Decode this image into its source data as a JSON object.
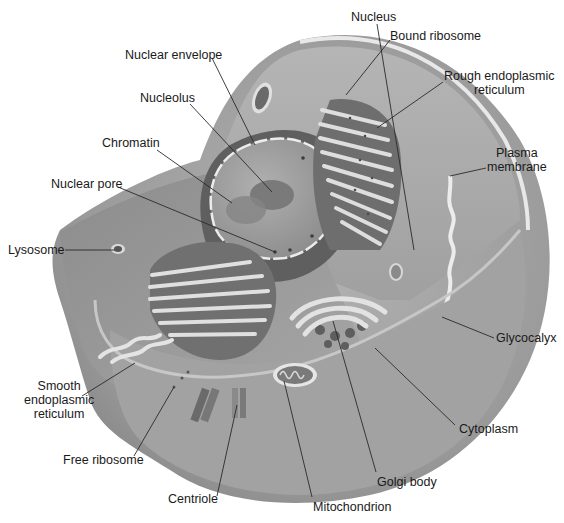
{
  "diagram": {
    "colors": {
      "background": "#ffffff",
      "cell_outer": "#8f8f8f",
      "cell_mid": "#a3a3a3",
      "cell_light": "#b8b8b8",
      "cut_face": "#9a9a9a",
      "membrane": "#e4e4e4",
      "nucleus_dark": "#5e5e5e",
      "nucleus_fill": "#9c9c9c",
      "organelle_light": "#dedede",
      "organelle_dark": "#6a6a6a",
      "leader_line": "#2a2a2a",
      "text": "#1a1a1a"
    },
    "labels": [
      {
        "id": "nucleus",
        "text": "Nucleus",
        "x": 351,
        "y": 10,
        "align": "left",
        "line": [
          [
            377,
            24
          ],
          [
            414,
            250
          ]
        ]
      },
      {
        "id": "nuclear-envelope",
        "text": "Nuclear envelope",
        "x": 125,
        "y": 48,
        "align": "left",
        "line": [
          [
            212,
            58
          ],
          [
            255,
            145
          ]
        ]
      },
      {
        "id": "bound-ribosome",
        "text": "Bound ribosome",
        "x": 390,
        "y": 29,
        "align": "left",
        "line": [
          [
            390,
            40
          ],
          [
            346,
            95
          ]
        ]
      },
      {
        "id": "rough-er",
        "text": "Rough endoplasmic\nreticulum",
        "x": 444,
        "y": 69,
        "align": "center",
        "line": [
          [
            443,
            82
          ],
          [
            377,
            128
          ]
        ]
      },
      {
        "id": "nucleolus",
        "text": "Nucleolus",
        "x": 140,
        "y": 91,
        "align": "left",
        "line": [
          [
            190,
            104
          ],
          [
            272,
            192
          ]
        ]
      },
      {
        "id": "chromatin",
        "text": "Chromatin",
        "x": 102,
        "y": 136,
        "align": "left",
        "line": [
          [
            157,
            150
          ],
          [
            232,
            203
          ]
        ]
      },
      {
        "id": "plasma-membrane",
        "text": "Plasma\nmembrane",
        "x": 487,
        "y": 146,
        "align": "center",
        "line": [
          [
            486,
            168
          ],
          [
            450,
            176
          ]
        ]
      },
      {
        "id": "nuclear-pore",
        "text": "Nuclear pore",
        "x": 51,
        "y": 177,
        "align": "left",
        "line": [
          [
            118,
            187
          ],
          [
            275,
            252
          ]
        ]
      },
      {
        "id": "lysosome",
        "text": "Lysosome",
        "x": 8,
        "y": 243,
        "align": "left",
        "line": [
          [
            65,
            250
          ],
          [
            115,
            250
          ]
        ]
      },
      {
        "id": "glycocalyx",
        "text": "Glycocalyx",
        "x": 496,
        "y": 331,
        "align": "left",
        "line": [
          [
            494,
            338
          ],
          [
            442,
            317
          ]
        ]
      },
      {
        "id": "smooth-er",
        "text": "Smooth\nendoplasmic\nreticulum",
        "x": 24,
        "y": 379,
        "align": "center",
        "line": [
          [
            82,
            396
          ],
          [
            135,
            363
          ]
        ]
      },
      {
        "id": "cytoplasm",
        "text": "Cytoplasm",
        "x": 459,
        "y": 422,
        "align": "left",
        "line": [
          [
            455,
            425
          ],
          [
            375,
            348
          ]
        ]
      },
      {
        "id": "free-ribosome",
        "text": "Free ribosome",
        "x": 63,
        "y": 453,
        "align": "left",
        "line": [
          [
            134,
            456
          ],
          [
            174,
            387
          ]
        ]
      },
      {
        "id": "golgi-body",
        "text": "Golgi body",
        "x": 377,
        "y": 475,
        "align": "left",
        "line": [
          [
            376,
            472
          ],
          [
            333,
            321
          ]
        ]
      },
      {
        "id": "centriole",
        "text": "Centriole",
        "x": 168,
        "y": 492,
        "align": "left",
        "line": [
          [
            217,
            496
          ],
          [
            237,
            405
          ]
        ]
      },
      {
        "id": "mitochondrion",
        "text": "Mitochondrion",
        "x": 313,
        "y": 500,
        "align": "left",
        "line": [
          [
            312,
            497
          ],
          [
            284,
            381
          ]
        ]
      }
    ]
  }
}
